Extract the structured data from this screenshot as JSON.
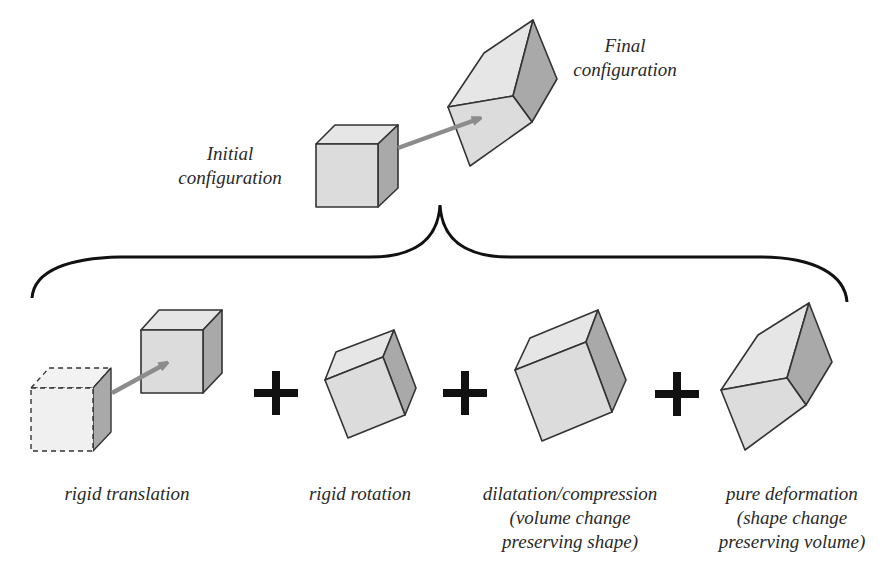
{
  "colors": {
    "outline": "#333333",
    "face_front": "#dcdcdc",
    "face_top": "#e6e6e6",
    "face_side": "#a9a9a9",
    "arrow": "#8c8c8c",
    "brace": "#111111",
    "plus": "#111111",
    "text": "#2a2a2a"
  },
  "top": {
    "initial_label": [
      "Initial",
      "configuration"
    ],
    "final_label": [
      "Final",
      "configuration"
    ]
  },
  "components": [
    {
      "id": "translation",
      "label": [
        "rigid translation"
      ]
    },
    {
      "id": "rotation",
      "label": [
        "rigid rotation"
      ]
    },
    {
      "id": "dilatation",
      "label": [
        "dilatation/compression",
        "(volume change",
        "preserving shape)"
      ]
    },
    {
      "id": "deformation",
      "label": [
        "pure deformation",
        "(shape change",
        "preserving volume)"
      ]
    }
  ],
  "operators": [
    "+",
    "+",
    "+"
  ]
}
